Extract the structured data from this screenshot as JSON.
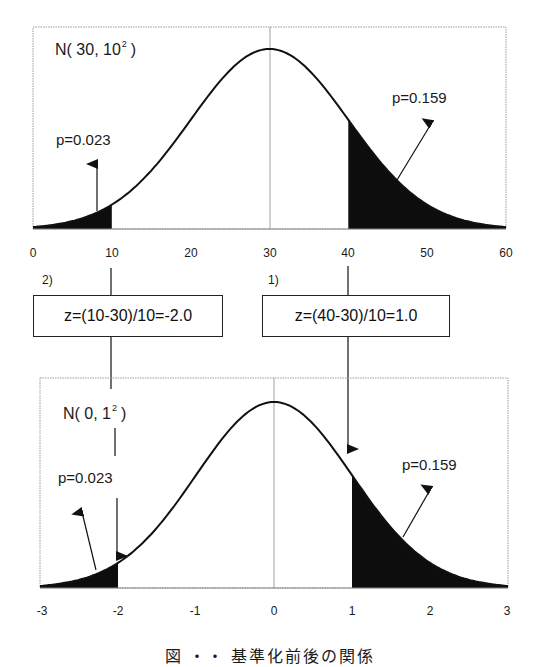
{
  "chart_data": [
    {
      "type": "area",
      "title": "N( 30, 10^2 )",
      "distribution": {
        "name": "normal",
        "mean": 30,
        "sd": 10
      },
      "xlabel": "",
      "ylabel": "",
      "xlim": [
        0,
        60
      ],
      "x_ticks": [
        0,
        10,
        20,
        30,
        40,
        50,
        60
      ],
      "shaded_regions": [
        {
          "from": 0,
          "to": 10,
          "p": 0.023,
          "label": "p=0.023"
        },
        {
          "from": 40,
          "to": 60,
          "p": 0.159,
          "label": "p=0.159"
        }
      ],
      "grid": false,
      "center_line": 30
    },
    {
      "type": "area",
      "title": "N( 0, 1^2 )",
      "distribution": {
        "name": "normal",
        "mean": 0,
        "sd": 1
      },
      "xlabel": "",
      "ylabel": "",
      "xlim": [
        -3,
        3
      ],
      "x_ticks": [
        -3,
        -2,
        -1,
        0,
        1,
        2,
        3
      ],
      "shaded_regions": [
        {
          "from": -3,
          "to": -2,
          "p": 0.023,
          "label": "p=0.023"
        },
        {
          "from": 1,
          "to": 3,
          "p": 0.159,
          "label": "p=0.159"
        }
      ],
      "grid": false,
      "center_line": 0
    }
  ],
  "top_plot": {
    "dist_name": "N( 30, 10",
    "dist_exp": "2",
    "dist_close": ")",
    "left_p": "p=0.023",
    "right_p": "p=0.159",
    "ticks": [
      "0",
      "10",
      "20",
      "30",
      "40",
      "50",
      "60"
    ]
  },
  "transforms": {
    "left": {
      "step": "2)",
      "formula": "z=(10-30)/10=-2.0"
    },
    "right": {
      "step": "1)",
      "formula": "z=(40-30)/10=1.0"
    }
  },
  "bottom_plot": {
    "dist_name": "N( 0, 1",
    "dist_exp": "2",
    "dist_close": ")",
    "left_p": "p=0.023",
    "right_p": "p=0.159",
    "ticks": [
      "-3",
      "-2",
      "-1",
      "0",
      "1",
      "2",
      "3"
    ]
  },
  "caption": "図 ・・  基準化前後の関係",
  "colors": {
    "ink": "#111111",
    "fill": "#0d0d0d",
    "frame": "#9a9a9a",
    "background": "#ffffff"
  }
}
